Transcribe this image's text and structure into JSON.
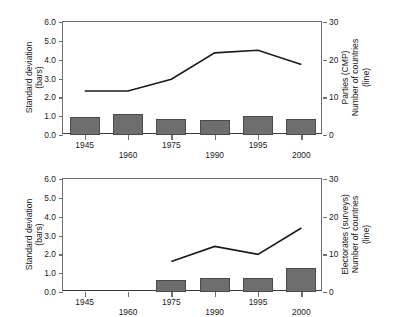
{
  "figure": {
    "panels": [
      {
        "id": "top",
        "left_axis_title_line1": "Standard deviation",
        "left_axis_title_line2": "(bars)",
        "right_axis_title_line1": "Parties (CMP)",
        "right_axis_title_line2": "Number of countries",
        "right_axis_title_line3": "(line)",
        "left_ticks": [
          "0.0",
          "1.0",
          "2.0",
          "3.0",
          "4.0",
          "5.0",
          "6.0"
        ],
        "right_ticks": [
          "0",
          "10",
          "20",
          "30"
        ],
        "x_ticks": [
          "1945",
          "1960",
          "1975",
          "1990",
          "1995",
          "2000"
        ]
      },
      {
        "id": "bottom",
        "left_axis_title_line1": "Standard deviation",
        "left_axis_title_line2": "(bars)",
        "right_axis_title_line1": "Electorates (surveys)",
        "right_axis_title_line2": "Number of countries",
        "right_axis_title_line3": "(line)",
        "left_ticks": [
          "0.0",
          "1.0",
          "2.0",
          "3.0",
          "4.0",
          "5.0",
          "6.0"
        ],
        "right_ticks": [
          "0",
          "10",
          "20",
          "30"
        ],
        "x_ticks": [
          "1945",
          "1960",
          "1975",
          "1990",
          "1995",
          "2000"
        ]
      }
    ]
  },
  "chart_data": [
    {
      "type": "bar",
      "id": "top-panel",
      "title": "",
      "categories": [
        "1945",
        "1960",
        "1975",
        "1990",
        "1995",
        "2000"
      ],
      "xlabel": "",
      "ylabel": "Standard deviation (bars)",
      "ylabel_right": "Parties (CMP) / Number of countries (line)",
      "ylim": [
        0,
        6
      ],
      "ylim_right": [
        0,
        30
      ],
      "grid": false,
      "legend": "none",
      "series": [
        {
          "name": "Standard deviation (bars)",
          "axis": "left",
          "type": "bar",
          "values": [
            0.93,
            1.1,
            0.87,
            0.79,
            1.02,
            0.86
          ]
        },
        {
          "name": "Number of countries (line)",
          "axis": "right",
          "type": "line",
          "values": [
            11.7,
            11.7,
            14.8,
            21.8,
            22.5,
            18.7
          ]
        }
      ]
    },
    {
      "type": "bar",
      "id": "bottom-panel",
      "title": "",
      "categories": [
        "1945",
        "1960",
        "1975",
        "1990",
        "1995",
        "2000"
      ],
      "xlabel": "",
      "ylabel": "Standard deviation (bars)",
      "ylabel_right": "Electorates (surveys) / Number of countries (line)",
      "ylim": [
        0,
        6
      ],
      "ylim_right": [
        0,
        30
      ],
      "grid": false,
      "legend": "none",
      "series": [
        {
          "name": "Standard deviation (bars)",
          "axis": "left",
          "type": "bar",
          "values": [
            null,
            null,
            0.66,
            0.73,
            0.76,
            1.27
          ]
        },
        {
          "name": "Number of countries (line)",
          "axis": "right",
          "type": "line",
          "values": [
            null,
            null,
            8.1,
            12.1,
            10.0,
            17.0
          ]
        }
      ]
    }
  ],
  "style": {
    "bar_fill": "#6e6e6e",
    "bar_stroke": "#4a4a4a",
    "line_color": "#1b1b1b",
    "axis_color": "#6f6f6f",
    "background": "#ffffff"
  }
}
